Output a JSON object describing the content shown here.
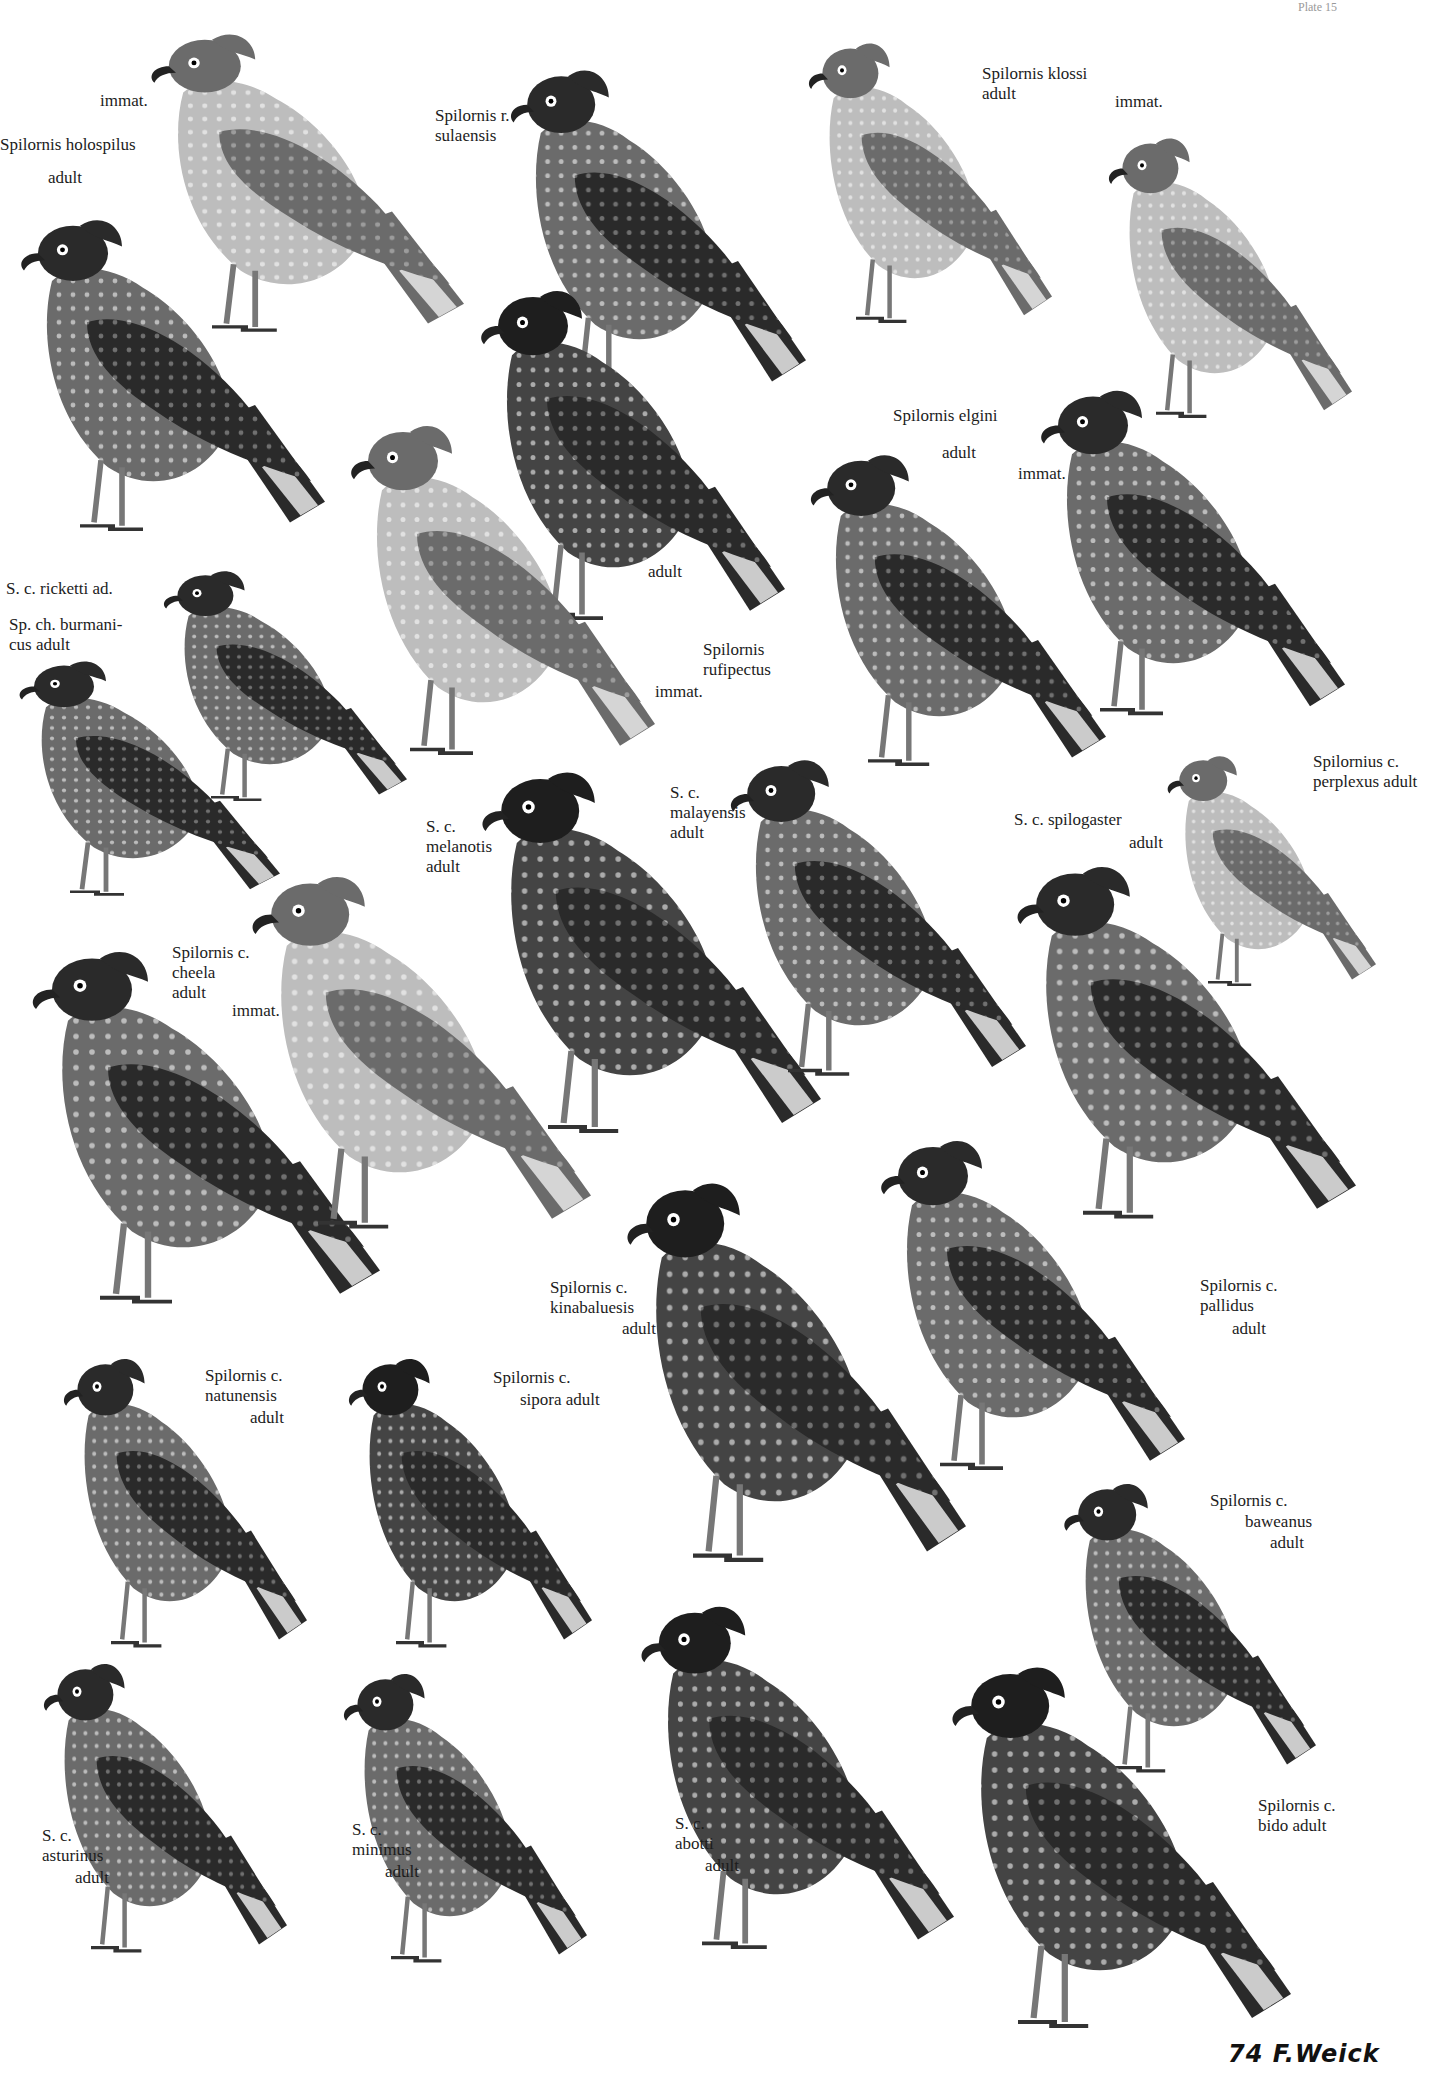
{
  "plate": {
    "subject": "Serpent eagles (Spilornis) illustration plate",
    "signature": "74 F.Weick",
    "plate_number": "Plate 15"
  },
  "colors": {
    "background": "#ffffff",
    "ink": "#1c1c1c",
    "plumage_dark": "#2a2a2a",
    "plumage_mid": "#6b6b6b",
    "plumage_light": "#bdbdbd"
  },
  "figures": [
    {
      "id": "holospilus-immat",
      "label": [
        "immat."
      ],
      "x": 140,
      "y": 20,
      "w": 360,
      "h": 330,
      "tone": "light"
    },
    {
      "id": "holospilus-adult",
      "label": [
        "Spilornis holospilus",
        "adult"
      ],
      "x": 10,
      "y": 205,
      "w": 350,
      "h": 345,
      "tone": "mid"
    },
    {
      "id": "rufipectus-sulaensis",
      "label": [
        "Spilornis r.",
        "sulaensis"
      ],
      "x": 500,
      "y": 55,
      "w": 340,
      "h": 355,
      "tone": "mid"
    },
    {
      "id": "klossi-adult",
      "label": [
        "Spilornis klossi",
        "adult"
      ],
      "x": 800,
      "y": 30,
      "w": 280,
      "h": 310,
      "tone": "light"
    },
    {
      "id": "klossi-immat",
      "label": [
        "immat."
      ],
      "x": 1100,
      "y": 125,
      "w": 280,
      "h": 310,
      "tone": "light"
    },
    {
      "id": "rufipectus-adult",
      "label": [
        "adult"
      ],
      "x": 470,
      "y": 275,
      "w": 350,
      "h": 365,
      "tone": "dark"
    },
    {
      "id": "rufipectus-immat",
      "label": [
        "Spilornis",
        "rufipectus",
        "immat."
      ],
      "x": 340,
      "y": 410,
      "w": 350,
      "h": 365,
      "tone": "light"
    },
    {
      "id": "elgini-adult",
      "label": [
        "Spilornis elgini",
        "adult"
      ],
      "x": 800,
      "y": 440,
      "w": 340,
      "h": 345,
      "tone": "mid"
    },
    {
      "id": "elgini-immat",
      "label": [
        "immat."
      ],
      "x": 1030,
      "y": 375,
      "w": 350,
      "h": 360,
      "tone": "mid"
    },
    {
      "id": "ricketti-adult",
      "label": [
        "S. c. ricketti ad."
      ],
      "x": 155,
      "y": 560,
      "w": 280,
      "h": 255,
      "tone": "mid"
    },
    {
      "id": "burmanicus-adult",
      "label": [
        "Sp. ch. burmani-",
        "cus adult"
      ],
      "x": 10,
      "y": 650,
      "w": 300,
      "h": 260,
      "tone": "mid"
    },
    {
      "id": "melanotis-adult",
      "label": [
        "S. c.",
        "melanotis",
        "adult"
      ],
      "x": 470,
      "y": 755,
      "w": 390,
      "h": 400,
      "tone": "dark"
    },
    {
      "id": "malayensis-adult",
      "label": [
        "S. c.",
        "malayensis",
        "adult"
      ],
      "x": 720,
      "y": 745,
      "w": 340,
      "h": 350,
      "tone": "mid"
    },
    {
      "id": "perplexus-adult",
      "label": [
        "Spilornius c.",
        "perplexus adult"
      ],
      "x": 1160,
      "y": 745,
      "w": 240,
      "h": 255,
      "tone": "light"
    },
    {
      "id": "spilogaster-adult",
      "label": [
        "S. c. spilogaster",
        "adult"
      ],
      "x": 1005,
      "y": 850,
      "w": 390,
      "h": 390,
      "tone": "mid"
    },
    {
      "id": "cheela-adult",
      "label": [
        "Spilornis c.",
        "cheela",
        "adult"
      ],
      "x": 20,
      "y": 935,
      "w": 400,
      "h": 390,
      "tone": "mid"
    },
    {
      "id": "cheela-immat",
      "label": [
        "immat."
      ],
      "x": 240,
      "y": 860,
      "w": 390,
      "h": 390,
      "tone": "light"
    },
    {
      "id": "kinabaluesis-adult",
      "label": [
        "Spilornis c.",
        "kinabaluesis",
        "adult"
      ],
      "x": 615,
      "y": 1165,
      "w": 390,
      "h": 420,
      "tone": "dark"
    },
    {
      "id": "pallidus-adult",
      "label": [
        "Spilornis c.",
        "pallidus",
        "adult"
      ],
      "x": 870,
      "y": 1125,
      "w": 350,
      "h": 365,
      "tone": "mid"
    },
    {
      "id": "natunensis-adult",
      "label": [
        "Spilornis c.",
        "natunensis",
        "adult"
      ],
      "x": 55,
      "y": 1345,
      "w": 280,
      "h": 320,
      "tone": "mid"
    },
    {
      "id": "sipora-adult",
      "label": [
        "Spilornis c.",
        "sipora adult"
      ],
      "x": 340,
      "y": 1345,
      "w": 280,
      "h": 320,
      "tone": "dark"
    },
    {
      "id": "baweanus-adult",
      "label": [
        "Spilornis c.",
        "baweanus",
        "adult"
      ],
      "x": 1055,
      "y": 1470,
      "w": 290,
      "h": 320,
      "tone": "mid"
    },
    {
      "id": "asturinus-adult",
      "label": [
        "S. c.",
        "asturinus",
        "adult"
      ],
      "x": 35,
      "y": 1650,
      "w": 280,
      "h": 320,
      "tone": "mid"
    },
    {
      "id": "minimus-adult",
      "label": [
        "S. c.",
        "minimus",
        "adult"
      ],
      "x": 335,
      "y": 1660,
      "w": 280,
      "h": 320,
      "tone": "mid"
    },
    {
      "id": "abotti-adult",
      "label": [
        "S. c.",
        "abotti",
        "adult"
      ],
      "x": 630,
      "y": 1590,
      "w": 360,
      "h": 380,
      "tone": "dark"
    },
    {
      "id": "bido-adult",
      "label": [
        "Spilornis c.",
        "bido adult"
      ],
      "x": 940,
      "y": 1650,
      "w": 390,
      "h": 400,
      "tone": "dark"
    }
  ],
  "labels": [
    {
      "id": "lbl-holospilus-immat",
      "lines": [
        "immat."
      ],
      "x": 100,
      "y": 103
    },
    {
      "id": "lbl-holospilus-adult",
      "lines": [
        "Spilornis holospilus"
      ],
      "x": 0,
      "y": 147
    },
    {
      "id": "lbl-holospilus-adult2",
      "lines": [
        "adult"
      ],
      "x": 48,
      "y": 180
    },
    {
      "id": "lbl-sulaensis",
      "lines": [
        "Spilornis r.",
        "sulaensis"
      ],
      "x": 435,
      "y": 118
    },
    {
      "id": "lbl-klossi",
      "lines": [
        "Spilornis klossi",
        "adult"
      ],
      "x": 982,
      "y": 76
    },
    {
      "id": "lbl-klossi-immat",
      "lines": [
        "immat."
      ],
      "x": 1115,
      "y": 104
    },
    {
      "id": "lbl-elgini",
      "lines": [
        "Spilornis elgini"
      ],
      "x": 893,
      "y": 418
    },
    {
      "id": "lbl-elgini-adult",
      "lines": [
        "adult"
      ],
      "x": 942,
      "y": 455
    },
    {
      "id": "lbl-elgini-immat",
      "lines": [
        "immat."
      ],
      "x": 1018,
      "y": 476
    },
    {
      "id": "lbl-rufipectus-adult",
      "lines": [
        "adult"
      ],
      "x": 648,
      "y": 574
    },
    {
      "id": "lbl-rufipectus",
      "lines": [
        "Spilornis",
        "rufipectus"
      ],
      "x": 703,
      "y": 652
    },
    {
      "id": "lbl-rufipectus-immat",
      "lines": [
        "immat."
      ],
      "x": 655,
      "y": 694
    },
    {
      "id": "lbl-ricketti",
      "lines": [
        "S. c. ricketti ad."
      ],
      "x": 6,
      "y": 591
    },
    {
      "id": "lbl-burmanicus",
      "lines": [
        "Sp. ch. burmani-",
        "cus adult"
      ],
      "x": 9,
      "y": 627
    },
    {
      "id": "lbl-melanotis",
      "lines": [
        "S. c.",
        "melanotis",
        "adult"
      ],
      "x": 426,
      "y": 829
    },
    {
      "id": "lbl-malayensis",
      "lines": [
        "S. c.",
        "malayensis",
        "adult"
      ],
      "x": 670,
      "y": 795
    },
    {
      "id": "lbl-spilogaster",
      "lines": [
        "S. c. spilogaster"
      ],
      "x": 1014,
      "y": 822
    },
    {
      "id": "lbl-spilogaster-adult",
      "lines": [
        "adult"
      ],
      "x": 1129,
      "y": 845
    },
    {
      "id": "lbl-perplexus",
      "lines": [
        "Spilornius c.",
        "perplexus adult"
      ],
      "x": 1313,
      "y": 764
    },
    {
      "id": "lbl-cheela",
      "lines": [
        "Spilornis c.",
        "cheela",
        "adult"
      ],
      "x": 172,
      "y": 955
    },
    {
      "id": "lbl-cheela-immat",
      "lines": [
        "immat."
      ],
      "x": 232,
      "y": 1013
    },
    {
      "id": "lbl-kinabaluesis",
      "lines": [
        "Spilornis c.",
        "kinabaluesis"
      ],
      "x": 550,
      "y": 1290
    },
    {
      "id": "lbl-kinabaluesis-adult",
      "lines": [
        "adult"
      ],
      "x": 622,
      "y": 1331
    },
    {
      "id": "lbl-pallidus",
      "lines": [
        "Spilornis c.",
        "pallidus"
      ],
      "x": 1200,
      "y": 1288
    },
    {
      "id": "lbl-pallidus-adult",
      "lines": [
        "adult"
      ],
      "x": 1232,
      "y": 1331
    },
    {
      "id": "lbl-natunensis",
      "lines": [
        "Spilornis c.",
        "natunensis"
      ],
      "x": 205,
      "y": 1378
    },
    {
      "id": "lbl-natunensis-adult",
      "lines": [
        "adult"
      ],
      "x": 250,
      "y": 1420
    },
    {
      "id": "lbl-sipora",
      "lines": [
        "Spilornis c."
      ],
      "x": 493,
      "y": 1380
    },
    {
      "id": "lbl-sipora-adult",
      "lines": [
        "sipora adult"
      ],
      "x": 520,
      "y": 1402
    },
    {
      "id": "lbl-baweanus",
      "lines": [
        "Spilornis c."
      ],
      "x": 1210,
      "y": 1503
    },
    {
      "id": "lbl-baweanus2",
      "lines": [
        "baweanus"
      ],
      "x": 1245,
      "y": 1524
    },
    {
      "id": "lbl-baweanus-adult",
      "lines": [
        "adult"
      ],
      "x": 1270,
      "y": 1545
    },
    {
      "id": "lbl-asturinus",
      "lines": [
        "S. c.",
        "asturinus"
      ],
      "x": 42,
      "y": 1838
    },
    {
      "id": "lbl-asturinus-adult",
      "lines": [
        "adult"
      ],
      "x": 75,
      "y": 1880
    },
    {
      "id": "lbl-minimus",
      "lines": [
        "S. c.",
        "minimus"
      ],
      "x": 352,
      "y": 1832
    },
    {
      "id": "lbl-minimus-adult",
      "lines": [
        "adult"
      ],
      "x": 385,
      "y": 1874
    },
    {
      "id": "lbl-abotti",
      "lines": [
        "S. c.",
        "abotti"
      ],
      "x": 675,
      "y": 1826
    },
    {
      "id": "lbl-abotti-adult",
      "lines": [
        "adult"
      ],
      "x": 705,
      "y": 1868
    },
    {
      "id": "lbl-bido",
      "lines": [
        "Spilornis c.",
        "bido adult"
      ],
      "x": 1258,
      "y": 1808
    }
  ]
}
